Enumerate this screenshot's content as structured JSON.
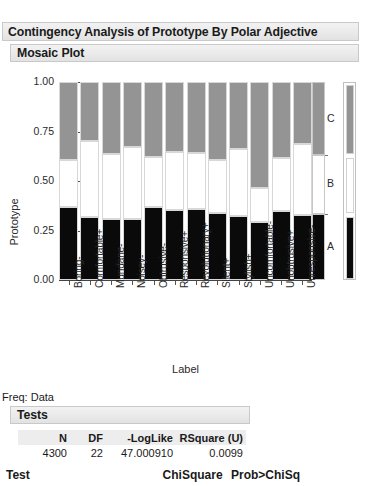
{
  "window": {
    "outer_title": "Contingency Analysis of Prototype By Polar Adjective",
    "mosaic_title": "Mosaic Plot"
  },
  "plot": {
    "y_axis_title": "Prototype",
    "x_axis_title": "Label",
    "y_ticks": [
      "1.00",
      "0.75",
      "0.50",
      "0.25",
      "0.00"
    ],
    "y_tick_values": [
      1.0,
      0.75,
      0.5,
      0.25,
      0.0
    ],
    "legend_labels": [
      "C",
      "B",
      "A"
    ],
    "colors": {
      "level_a": "#0a0a0a",
      "level_b": "#ffffff",
      "level_c": "#949494",
      "border": "#d8d8d8"
    }
  },
  "chart_data": {
    "type": "bar",
    "subtype": "mosaic",
    "title": "Mosaic Plot",
    "xlabel": "Label",
    "ylabel": "Prototype",
    "ylim": [
      0,
      1
    ],
    "grid": false,
    "legend_position": "right",
    "stacked": true,
    "normalized": true,
    "categories": [
      "Boring-",
      "Comfortable+",
      "Mundane-",
      "Noisey-",
      "Obtrusive-",
      "Responsive+",
      "Revolutionary+",
      "Silent+",
      "Stylish+",
      "Uncomfortable-",
      "Unobtrusive+",
      "Unresponsive-"
    ],
    "series": [
      {
        "name": "A",
        "color": "#0a0a0a",
        "values": [
          0.37,
          0.32,
          0.31,
          0.31,
          0.37,
          0.355,
          0.36,
          0.34,
          0.325,
          0.295,
          0.35,
          0.33
        ]
      },
      {
        "name": "B",
        "color": "#ffffff",
        "values": [
          0.235,
          0.38,
          0.325,
          0.36,
          0.25,
          0.29,
          0.28,
          0.265,
          0.335,
          0.17,
          0.265,
          0.355
        ]
      },
      {
        "name": "C",
        "color": "#949494",
        "values": [
          0.395,
          0.3,
          0.365,
          0.33,
          0.38,
          0.355,
          0.36,
          0.395,
          0.34,
          0.535,
          0.385,
          0.315
        ]
      }
    ],
    "marginal_totals": {
      "A": 0.335,
      "B": 0.295,
      "C": 0.37
    }
  },
  "stats": {
    "freq_line": "Freq: Data",
    "tests_title": "Tests",
    "columns": [
      "N",
      "DF",
      "-LogLike",
      "RSquare (U)"
    ],
    "values": [
      "4300",
      "22",
      "47.000910",
      "0.0099"
    ],
    "test_header": {
      "test": "Test",
      "chisquare": "ChiSquare",
      "prob": "Prob>ChiSq"
    }
  }
}
